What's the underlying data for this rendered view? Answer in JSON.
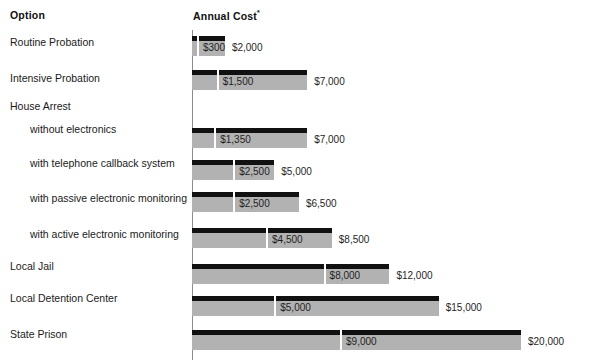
{
  "header": {
    "option_label": "Option",
    "cost_label": "Annual Cost",
    "cost_footnote_marker": "*"
  },
  "colors": {
    "high_bar": "#111111",
    "low_bar": "#b2b2b2",
    "axis": "#8c8c8c",
    "background": "#ffffff",
    "text": "#1a1a1a"
  },
  "chart_data": {
    "type": "bar",
    "title": "Annual Cost",
    "xlabel": "Annual Cost",
    "ylabel": "Option",
    "orientation": "horizontal",
    "grid": false,
    "legend": "none",
    "xlim": [
      0,
      20000
    ],
    "categories": [
      "Routine Probation",
      "Intensive Probation",
      "House Arrest",
      "without electronics",
      "with telephone callback system",
      "with passive electronic monitoring",
      "with active electronic monitoring",
      "Local Jail",
      "Local Detention Center",
      "State Prison"
    ],
    "series": [
      {
        "name": "Low estimate",
        "values": [
          300,
          1500,
          null,
          1350,
          2500,
          2500,
          4500,
          8000,
          5000,
          9000
        ]
      },
      {
        "name": "High estimate",
        "values": [
          2000,
          7000,
          null,
          7000,
          5000,
          6500,
          8500,
          12000,
          15000,
          20000
        ]
      }
    ],
    "rows": [
      {
        "label": "Routine Probation",
        "indent": 0,
        "group": false,
        "low": 300,
        "high": 2000,
        "low_label": "$300",
        "high_label": "$2,000"
      },
      {
        "label": "Intensive Probation",
        "indent": 0,
        "group": false,
        "low": 1500,
        "high": 7000,
        "low_label": "$1,500",
        "high_label": "$7,000"
      },
      {
        "label": "House Arrest",
        "indent": 0,
        "group": true,
        "low": null,
        "high": null,
        "low_label": "",
        "high_label": ""
      },
      {
        "label": "without electronics",
        "indent": 1,
        "group": false,
        "low": 1350,
        "high": 7000,
        "low_label": "$1,350",
        "high_label": "$7,000"
      },
      {
        "label": "with telephone callback system",
        "indent": 1,
        "group": false,
        "low": 2500,
        "high": 5000,
        "low_label": "$2,500",
        "high_label": "$5,000"
      },
      {
        "label": "with passive electronic monitoring",
        "indent": 1,
        "group": false,
        "low": 2500,
        "high": 6500,
        "low_label": "$2,500",
        "high_label": "$6,500"
      },
      {
        "label": "with active electronic monitoring",
        "indent": 1,
        "group": false,
        "low": 4500,
        "high": 8500,
        "low_label": "$4,500",
        "high_label": "$8,500"
      },
      {
        "label": "Local Jail",
        "indent": 0,
        "group": false,
        "low": 8000,
        "high": 12000,
        "low_label": "$8,000",
        "high_label": "$12,000"
      },
      {
        "label": "Local Detention Center",
        "indent": 0,
        "group": false,
        "low": 5000,
        "high": 15000,
        "low_label": "$5,000",
        "high_label": "$15,000"
      },
      {
        "label": "State Prison",
        "indent": 0,
        "group": false,
        "low": 9000,
        "high": 20000,
        "low_label": "$9,000",
        "high_label": "$20,000"
      }
    ]
  },
  "layout": {
    "axis_x": 192,
    "px_per_dollar": 0.01645,
    "row_tops": [
      36,
      70,
      104,
      128,
      160,
      192,
      228,
      264,
      296,
      330
    ],
    "label_baselines": [
      46,
      82,
      110,
      133,
      167,
      202,
      238,
      270,
      302,
      338
    ]
  }
}
